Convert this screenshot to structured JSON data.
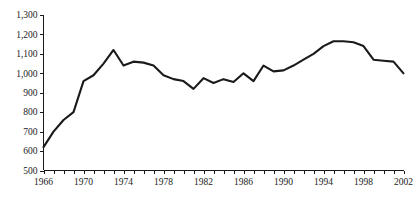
{
  "chart_data": {
    "type": "line",
    "title": "",
    "subtitle": "",
    "xlabel": "",
    "ylabel": "",
    "xlim": [
      1966,
      2002
    ],
    "ylim": [
      500,
      1300
    ],
    "grid": false,
    "legend": false,
    "legend_position": "none",
    "line_color": "#1a1a1a",
    "axis_color": "#1a1a1a",
    "background_color": "#ffffff",
    "y_ticks": [
      500,
      600,
      700,
      800,
      900,
      1000,
      1100,
      1200,
      1300
    ],
    "y_tick_labels": [
      "500",
      "600",
      "700",
      "800",
      "900",
      "1,000",
      "1,100",
      "1,200",
      "1,300"
    ],
    "x_ticks": [
      1966,
      1967,
      1968,
      1969,
      1970,
      1971,
      1972,
      1973,
      1974,
      1975,
      1976,
      1977,
      1978,
      1979,
      1980,
      1981,
      1982,
      1983,
      1984,
      1985,
      1986,
      1987,
      1988,
      1989,
      1990,
      1991,
      1992,
      1993,
      1994,
      1995,
      1996,
      1997,
      1998,
      1999,
      2000,
      2001,
      2002
    ],
    "x_tick_labels": [
      "1966",
      "1970",
      "1974",
      "1978",
      "1982",
      "1986",
      "1990",
      "1994",
      "1998",
      "2002"
    ],
    "x_labeled_ticks": [
      1966,
      1970,
      1974,
      1978,
      1982,
      1986,
      1990,
      1994,
      1998,
      2002
    ],
    "x": [
      1966,
      1967,
      1968,
      1969,
      1970,
      1971,
      1972,
      1973,
      1974,
      1975,
      1976,
      1977,
      1978,
      1979,
      1980,
      1981,
      1982,
      1983,
      1984,
      1985,
      1986,
      1987,
      1988,
      1989,
      1990,
      1991,
      1992,
      1993,
      1994,
      1995,
      1996,
      1997,
      1998,
      1999,
      2000,
      2001,
      2002
    ],
    "values": [
      620,
      700,
      760,
      800,
      960,
      990,
      1050,
      1120,
      1040,
      1060,
      1055,
      1040,
      990,
      970,
      960,
      920,
      975,
      950,
      970,
      955,
      1000,
      960,
      1040,
      1010,
      1015,
      1040,
      1070,
      1100,
      1140,
      1165,
      1165,
      1160,
      1140,
      1070,
      1065,
      1060,
      1000
    ],
    "series": [
      {
        "name": "series-1",
        "values": [
          620,
          700,
          760,
          800,
          960,
          990,
          1050,
          1120,
          1040,
          1060,
          1055,
          1040,
          990,
          970,
          960,
          920,
          975,
          950,
          970,
          955,
          1000,
          960,
          1040,
          1010,
          1015,
          1040,
          1070,
          1100,
          1140,
          1165,
          1165,
          1160,
          1140,
          1070,
          1065,
          1060,
          1000
        ],
        "color": "#1a1a1a"
      }
    ],
    "annotations": []
  }
}
